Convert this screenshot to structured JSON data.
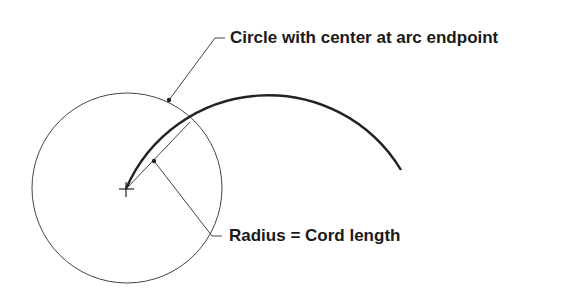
{
  "diagram": {
    "labels": {
      "circle_label": "Circle with center at arc endpoint",
      "radius_label": "Radius = Cord length"
    },
    "colors": {
      "stroke": "#333333",
      "text": "#1a1a1a",
      "background": "#ffffff"
    },
    "elements": {
      "circle": {
        "cx": 127,
        "cy": 188,
        "r": 95
      },
      "arc": {
        "start": [
          126,
          189
        ],
        "end": [
          401,
          170
        ],
        "radius": 155
      },
      "chord": {
        "start": [
          126,
          189
        ],
        "end": [
          190,
          122
        ]
      },
      "center_mark": [
        126,
        189
      ]
    }
  }
}
